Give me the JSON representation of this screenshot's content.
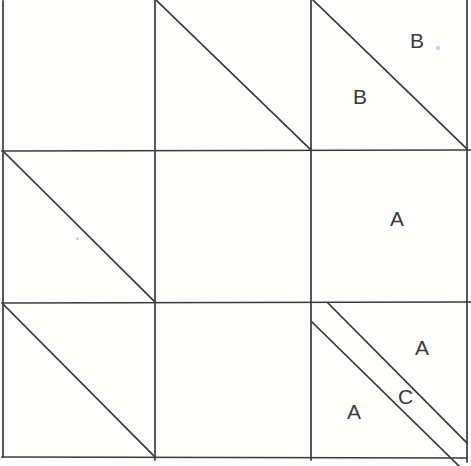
{
  "figure": {
    "title": "",
    "canvas": {
      "width": 471,
      "height": 466
    },
    "background_color": "#fdfdfc",
    "line_color": "#3b3b3b",
    "label_color": "#3a3a3a",
    "stroke_width": 1.7,
    "grid": {
      "x_lines": [
        3,
        155,
        311,
        467
      ],
      "y_lines": [
        1,
        151,
        303,
        457
      ],
      "rows": 3,
      "cols": 3
    },
    "cells": [
      {
        "row": 0,
        "col": 0,
        "diagonals": [],
        "labels": []
      },
      {
        "row": 0,
        "col": 1,
        "diagonals": [
          "tl-br"
        ],
        "labels": []
      },
      {
        "row": 0,
        "col": 2,
        "diagonals": [
          "tl-br"
        ],
        "labels": [
          "B",
          "B"
        ]
      },
      {
        "row": 1,
        "col": 0,
        "diagonals": [
          "tl-br"
        ],
        "labels": []
      },
      {
        "row": 1,
        "col": 1,
        "diagonals": [],
        "labels": []
      },
      {
        "row": 1,
        "col": 2,
        "diagonals": [],
        "labels": [
          "A"
        ]
      },
      {
        "row": 2,
        "col": 0,
        "diagonals": [
          "tl-br"
        ],
        "labels": []
      },
      {
        "row": 2,
        "col": 1,
        "diagonals": [],
        "labels": []
      },
      {
        "row": 2,
        "col": 2,
        "diagonals": [
          "tl-br",
          "tl-br-offset"
        ],
        "labels": [
          "A",
          "C",
          "A"
        ]
      }
    ],
    "lines": [
      {
        "name": "border-left",
        "x1": 3,
        "y1": 1,
        "x2": 3,
        "y2": 457
      },
      {
        "name": "grid-vertical-1",
        "x1": 155,
        "y1": 0,
        "x2": 155,
        "y2": 460
      },
      {
        "name": "grid-vertical-2",
        "x1": 311,
        "y1": 0,
        "x2": 311,
        "y2": 460
      },
      {
        "name": "border-right",
        "x1": 467,
        "y1": 0,
        "x2": 467,
        "y2": 462
      },
      {
        "name": "grid-horizontal-1",
        "x1": 2,
        "y1": 151,
        "x2": 471,
        "y2": 150
      },
      {
        "name": "grid-horizontal-2",
        "x1": 2,
        "y1": 303,
        "x2": 471,
        "y2": 302
      },
      {
        "name": "border-bottom",
        "x1": 2,
        "y1": 457,
        "x2": 467,
        "y2": 458
      },
      {
        "name": "diagonal-r0c1",
        "x1": 156,
        "y1": 0,
        "x2": 310,
        "y2": 149
      },
      {
        "name": "diagonal-r0c2",
        "x1": 313,
        "y1": 0,
        "x2": 466,
        "y2": 148
      },
      {
        "name": "diagonal-r1c0",
        "x1": 4,
        "y1": 152,
        "x2": 155,
        "y2": 302
      },
      {
        "name": "diagonal-r2c0",
        "x1": 4,
        "y1": 305,
        "x2": 155,
        "y2": 457
      },
      {
        "name": "diagonal-r2c2-upper",
        "x1": 328,
        "y1": 303,
        "x2": 467,
        "y2": 443
      },
      {
        "name": "diagonal-r2c2-lower",
        "x1": 312,
        "y1": 322,
        "x2": 459,
        "y2": 466
      }
    ],
    "labels": [
      {
        "name": "label-b-upper-right",
        "text": "B",
        "x": 410,
        "y": 30
      },
      {
        "name": "label-b-lower-left",
        "text": "B",
        "x": 353,
        "y": 86
      },
      {
        "name": "label-a-middle-right",
        "text": "A",
        "x": 390,
        "y": 208
      },
      {
        "name": "label-a-bottom-upper",
        "text": "A",
        "x": 415,
        "y": 337
      },
      {
        "name": "label-c-bottom-strip",
        "text": "C",
        "x": 398,
        "y": 386
      },
      {
        "name": "label-a-bottom-lower",
        "text": "A",
        "x": 347,
        "y": 401
      }
    ],
    "specks": [
      {
        "x": 76,
        "y": 237,
        "size": 3
      },
      {
        "x": 436,
        "y": 46,
        "size": 4
      }
    ]
  }
}
